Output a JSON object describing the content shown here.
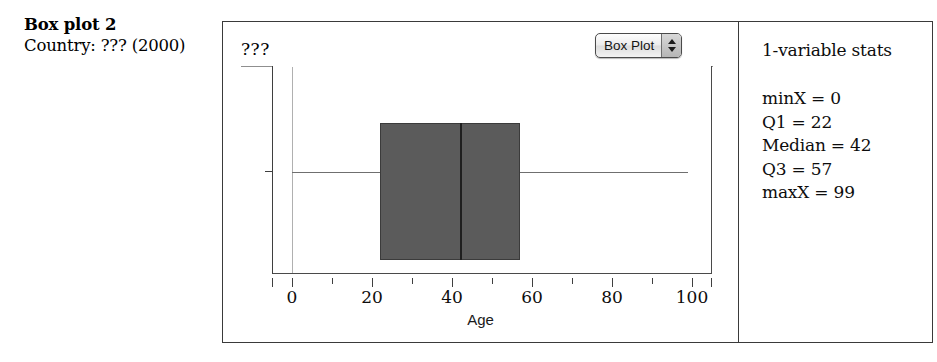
{
  "caption": {
    "title": "Box plot 2",
    "subtitle": "Country: ??? (2000)"
  },
  "plot": {
    "variable_label": "???",
    "plot_type_menu": {
      "selected": "Box Plot",
      "up_icon": "triangle-up-icon",
      "down_icon": "triangle-down-icon"
    },
    "axis_title": "Age",
    "tick_labels": [
      "0",
      "20",
      "40",
      "60",
      "80",
      "100"
    ]
  },
  "stats": {
    "title": "1-variable stats",
    "rows": [
      "minX = 0",
      "Q1 = 22",
      "Median = 42",
      "Q3 = 57",
      "maxX = 99"
    ]
  },
  "chart_data": {
    "type": "box",
    "title": "Box plot 2",
    "subtitle": "Country: ??? (2000)",
    "xlabel": "Age",
    "ylabel": "",
    "series_label": "???",
    "xlim": [
      -5,
      105
    ],
    "xticks": [
      0,
      20,
      40,
      60,
      80,
      100
    ],
    "xticks_minor_step": 10,
    "grid": false,
    "legend": "none",
    "orientation": "horizontal",
    "boxes": [
      {
        "name": "???",
        "min": 0,
        "q1": 22,
        "median": 42,
        "q3": 57,
        "max": 99,
        "fill_color": "#5b5b5b",
        "line_color": "#3b3b3b"
      }
    ],
    "stats_panel": {
      "minX": 0,
      "Q1": 22,
      "Median": 42,
      "Q3": 57,
      "maxX": 99
    }
  },
  "colors": {
    "box_fill": "#5b5b5b",
    "frame": "#3a3a3a",
    "gridline": "#b0b0b0",
    "text": "#0d0d0d"
  }
}
